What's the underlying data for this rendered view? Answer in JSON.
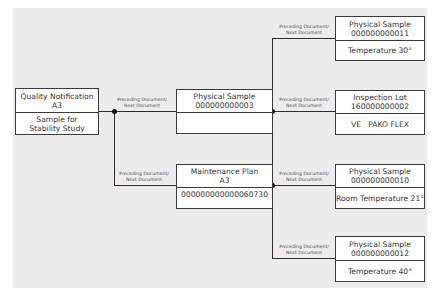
{
  "diagram": {
    "edge_label_line1": "Preceding Document/",
    "edge_label_line2": "Next Document",
    "nodes": {
      "quality_notification": {
        "title": "Quality Notification",
        "id": "A3",
        "detail_line1": "Sample for",
        "detail_line2": "Stability Study"
      },
      "physical_sample_3": {
        "title": "Physical Sample",
        "id": "000000000003",
        "detail": ""
      },
      "maintenance_plan": {
        "title": "Maintenance Plan",
        "id": "A3",
        "detail": "000000000000060730"
      },
      "physical_sample_11": {
        "title": "Physical Sample",
        "id": "000000000011",
        "detail": "Temperature 30°"
      },
      "inspection_lot": {
        "title": "Inspection Lot",
        "id": "160000000002",
        "detail": "VE   PAKO FLEX"
      },
      "physical_sample_10": {
        "title": "Physical Sample",
        "id": "000000000010",
        "detail": "Room Temperature 21°"
      },
      "physical_sample_12": {
        "title": "Physical Sample",
        "id": "000000000012",
        "detail": "Temperature 40°"
      }
    }
  }
}
